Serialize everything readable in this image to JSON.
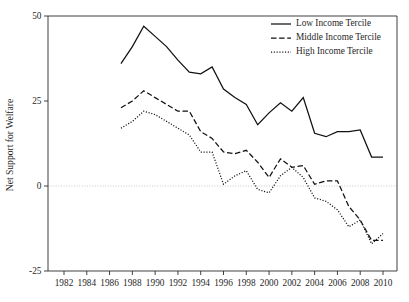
{
  "chart_data": {
    "type": "line",
    "title": "",
    "subtitle": "",
    "xlabel": "",
    "ylabel": "Net Support for Welfare",
    "xlim": [
      1981,
      2011
    ],
    "ylim": [
      -30,
      52
    ],
    "xticks": [
      1982,
      1984,
      1986,
      1988,
      1990,
      1992,
      1994,
      1996,
      1998,
      2000,
      2002,
      2004,
      2006,
      2008,
      2010
    ],
    "yticks": [
      50,
      25,
      0,
      -25
    ],
    "grid": "zero-line-only",
    "legend_position": "top-right",
    "x": [
      1987,
      1988,
      1989,
      1990,
      1991,
      1992,
      1993,
      1994,
      1995,
      1996,
      1997,
      1998,
      1999,
      2000,
      2001,
      2002,
      2003,
      2004,
      2005,
      2006,
      2007,
      2008,
      2009,
      2010
    ],
    "series": [
      {
        "name": "Low Income Tercile",
        "style": "solid",
        "values": [
          36,
          41,
          47,
          44,
          41,
          37,
          33.5,
          33,
          35,
          28.5,
          26,
          24,
          18,
          21.5,
          24.5,
          22,
          26,
          15.5,
          14.5,
          16,
          16,
          16.5,
          8.5,
          8.5
        ]
      },
      {
        "name": "Middle Income Tercile",
        "style": "dashed",
        "values": [
          23,
          25,
          28,
          26,
          24,
          22,
          22,
          16,
          14,
          10,
          9.5,
          10.5,
          7,
          2.5,
          8,
          5.5,
          6,
          0.5,
          1.5,
          1.5,
          -6,
          -10,
          -16,
          -16
        ]
      },
      {
        "name": "High Income Tercile",
        "style": "dotted",
        "values": [
          17,
          19,
          22,
          21,
          19,
          17,
          15,
          10,
          10,
          0.5,
          3,
          4.5,
          -1,
          -2,
          3,
          5.5,
          2.5,
          -3.5,
          -4.5,
          -7,
          -12,
          -10,
          -17,
          -14
        ]
      }
    ],
    "legend": [
      {
        "label": "Low Income Tercile",
        "style": "solid"
      },
      {
        "label": "Middle Income Tercile",
        "style": "dashed"
      },
      {
        "label": "High Income Tercile",
        "style": "dotted"
      }
    ],
    "colors": {
      "line": "#111111",
      "axis": "#2b2b2b",
      "zero_grid": "#b9b9b9",
      "background": "#ffffff"
    }
  }
}
